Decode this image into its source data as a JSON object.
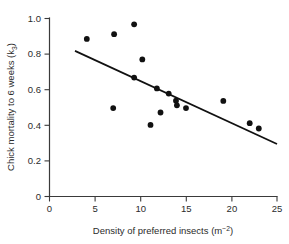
{
  "chart_data": {
    "type": "scatter",
    "title": "",
    "xlabel": "Density of preferred insects (m⁻²)",
    "ylabel": "Chick mortality to 6 weeks (k₃)",
    "xlabel_parts": {
      "base": "Density of preferred insects (m",
      "exponent": "−2",
      "tail": ")"
    },
    "ylabel_parts": {
      "base": "Chick mortality to 6 weeks (k",
      "subscript": "3",
      "tail": ")"
    },
    "xlim": [
      0,
      25
    ],
    "ylim": [
      0,
      1.0
    ],
    "xticks": [
      0,
      5,
      10,
      15,
      20,
      25
    ],
    "yticks": [
      0,
      0.2,
      0.4,
      0.6,
      0.8,
      1.0
    ],
    "xtick_labels": [
      "0",
      "5",
      "10",
      "15",
      "20",
      "25"
    ],
    "ytick_labels": [
      "0",
      "0.2",
      "0.4",
      "0.6",
      "0.8",
      "1.0"
    ],
    "grid": false,
    "legend": null,
    "point_color": "#111111",
    "line_color": "#111111",
    "axis_color": "#3a3a3a",
    "points": [
      {
        "x": 4.1,
        "y": 0.885
      },
      {
        "x": 7.1,
        "y": 0.912
      },
      {
        "x": 9.3,
        "y": 0.967
      },
      {
        "x": 10.2,
        "y": 0.77
      },
      {
        "x": 9.3,
        "y": 0.668
      },
      {
        "x": 11.8,
        "y": 0.607
      },
      {
        "x": 13.1,
        "y": 0.578
      },
      {
        "x": 13.9,
        "y": 0.538
      },
      {
        "x": 14.0,
        "y": 0.512
      },
      {
        "x": 15.0,
        "y": 0.497
      },
      {
        "x": 12.2,
        "y": 0.472
      },
      {
        "x": 7.0,
        "y": 0.497
      },
      {
        "x": 11.1,
        "y": 0.402
      },
      {
        "x": 19.1,
        "y": 0.537
      },
      {
        "x": 22.0,
        "y": 0.412
      },
      {
        "x": 23.0,
        "y": 0.382
      }
    ],
    "trend_line": {
      "x_start": 2.8,
      "y_start": 0.818,
      "x_end": 25.0,
      "y_end": 0.295
    }
  }
}
